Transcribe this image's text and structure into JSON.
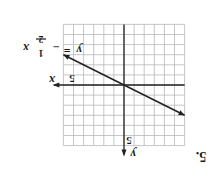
{
  "problem": {
    "number_label": "5.",
    "orientation": "rotated 180 degrees"
  },
  "graph": {
    "equation": "y = -1/2 x",
    "equation_parts": {
      "lhs": "y",
      "eq": "=",
      "sign": "−",
      "num": "1",
      "den": "2",
      "var": "x"
    },
    "x_axis_label": "x",
    "y_axis_label": "y",
    "x_tick_label": "5",
    "y_tick_label": "5",
    "grid": {
      "min": -6,
      "max": 6,
      "step": 1
    },
    "line": {
      "slope": -0.5,
      "intercept": 0,
      "x_range": [
        -6,
        6
      ]
    },
    "colors": {
      "grid": "#b8b8b8",
      "axis": "#222222",
      "line": "#222222"
    }
  }
}
